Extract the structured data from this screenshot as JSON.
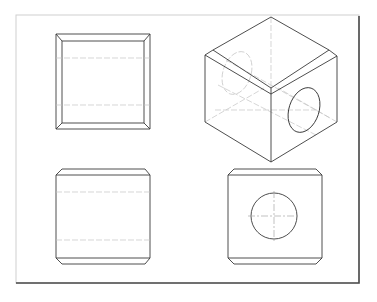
{
  "drawing": {
    "title": "",
    "type": "orthographic-and-isometric-projection",
    "object": "chamfered cube with through hole",
    "views": [
      {
        "name": "top-view",
        "label": ""
      },
      {
        "name": "isometric-view",
        "label": ""
      },
      {
        "name": "front-view",
        "label": ""
      },
      {
        "name": "side-view",
        "label": ""
      }
    ],
    "colors": {
      "visible_line": "#3a3a3a",
      "hidden_line": "#c4c4c4",
      "center_line": "#a8a8a8",
      "frame_shadow": "#4a4a4a",
      "background": "#ffffff"
    }
  }
}
